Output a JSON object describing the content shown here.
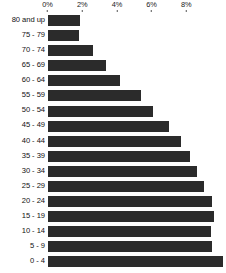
{
  "chart_data": {
    "type": "bar",
    "orientation": "horizontal",
    "title": "",
    "subtitle": "",
    "xlabel": "",
    "ylabel": "",
    "grid": false,
    "legend": null,
    "axis_position": "top",
    "xlim": [
      0,
      10.2
    ],
    "xticks": [
      0,
      2,
      4,
      6,
      8
    ],
    "xtick_labels": [
      "0%",
      "2%",
      "4%",
      "6%",
      "8%"
    ],
    "bar_color": "#2b2b2b",
    "categories": [
      "80 and up",
      "75 - 79",
      "70 - 74",
      "65 - 69",
      "60 - 64",
      "55 - 59",
      "50 - 54",
      "45 - 49",
      "40 - 44",
      "35 - 39",
      "30 - 34",
      "25 - 29",
      "20 - 24",
      "15 - 19",
      "10 - 14",
      "5 - 9",
      "0 - 4"
    ],
    "values": [
      1.9,
      1.8,
      2.6,
      3.4,
      4.2,
      5.4,
      6.1,
      7.0,
      7.7,
      8.2,
      8.6,
      9.0,
      9.5,
      9.6,
      9.4,
      9.5,
      10.1
    ],
    "value_unit": "%"
  }
}
